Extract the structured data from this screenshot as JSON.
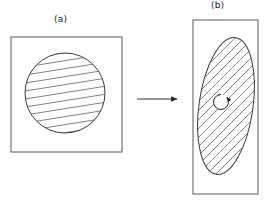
{
  "figure": {
    "background_color": "#ffffff",
    "stroke_color": "#3a3a3a",
    "hatch_color": "#4a4a4a",
    "width": 269,
    "height": 204,
    "labels": {
      "panel_a": "(a)",
      "panel_b": "(b)"
    },
    "panel_a": {
      "name": "undeformed-state",
      "frame": {
        "shape": "square",
        "x": 11,
        "y": 37,
        "width": 111,
        "height": 115
      },
      "region": {
        "shape": "circle",
        "cx": 65,
        "cy": 93,
        "rx": 40,
        "ry": 40,
        "rotation_deg": 0,
        "hatch_angle_deg": 9,
        "hatch_spacing": 8,
        "hatch_line_count": 20
      }
    },
    "panel_b": {
      "name": "deformed-state",
      "frame": {
        "shape": "rectangle",
        "x": 193,
        "y": 20,
        "width": 65,
        "height": 174
      },
      "region": {
        "shape": "ellipse",
        "cx": 226,
        "cy": 106,
        "rx": 27,
        "ry": 69,
        "rotation_deg": 8,
        "hatch_angle_deg": 46,
        "hatch_spacing": 9,
        "hatch_line_count": 18
      },
      "rotation_marker": {
        "name": "rotation-arrow",
        "cx": 221,
        "cy": 102,
        "radius": 7.5,
        "direction": "clockwise"
      }
    },
    "transition_arrow": {
      "name": "transition-arrow",
      "x1": 137,
      "y1": 99,
      "x2": 180,
      "y2": 99,
      "direction": "right"
    }
  }
}
